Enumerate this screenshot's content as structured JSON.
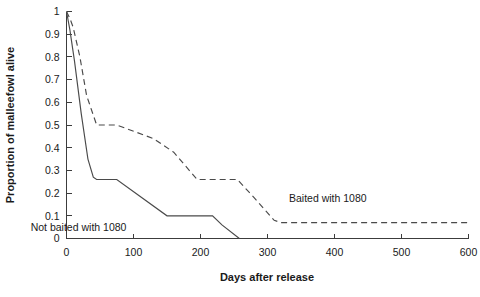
{
  "chart_data": {
    "type": "line",
    "title": "",
    "xlabel": "Days after release",
    "ylabel": "Proportion of malleefowl alive",
    "xlim": [
      0,
      600
    ],
    "ylim": [
      0,
      1
    ],
    "grid": false,
    "legend_position": "inline-annotation",
    "x_ticks": [
      "0",
      "100",
      "200",
      "300",
      "400",
      "500",
      "600"
    ],
    "x_tick_values": [
      0,
      100,
      200,
      300,
      400,
      500,
      600
    ],
    "y_ticks": [
      "0",
      "0.1",
      "0.2",
      "0.3",
      "0.4",
      "0.5",
      "0.6",
      "0.7",
      "0.8",
      "0.9",
      "1"
    ],
    "y_tick_values": [
      0,
      0.1,
      0.2,
      0.3,
      0.4,
      0.5,
      0.6,
      0.7,
      0.8,
      0.9,
      1
    ],
    "series": [
      {
        "name": "Baited with 1080",
        "style": "dashed",
        "color": "#4a4a4a",
        "label_text": "Baited with 1080",
        "label_x": 390,
        "label_y": 0.16,
        "x": [
          0,
          5,
          10,
          20,
          30,
          45,
          60,
          75,
          130,
          160,
          195,
          255,
          280,
          310,
          320,
          600
        ],
        "y": [
          1.0,
          0.97,
          0.93,
          0.8,
          0.63,
          0.5,
          0.5,
          0.5,
          0.44,
          0.38,
          0.26,
          0.26,
          0.18,
          0.08,
          0.07,
          0.07
        ]
      },
      {
        "name": "Not baited with 1080",
        "style": "solid",
        "color": "#4a4a4a",
        "label_text": "Not baited with 1080",
        "label_x": 18,
        "label_y": 0.035,
        "x": [
          0,
          5,
          12,
          22,
          32,
          40,
          45,
          75,
          150,
          218,
          232,
          258
        ],
        "y": [
          1.0,
          0.92,
          0.78,
          0.55,
          0.35,
          0.27,
          0.26,
          0.26,
          0.1,
          0.1,
          0.06,
          0.0
        ]
      }
    ]
  },
  "axes": {
    "x_title": "Days after release",
    "y_title": "Proportion of malleefowl alive"
  }
}
